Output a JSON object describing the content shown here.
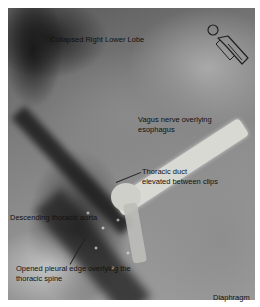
{
  "figure": {
    "type": "annotated surgical photograph (grayscale)",
    "labels": {
      "lung": "Collapsed Right Lower Lobe",
      "vagus": [
        "Vagus nerve overlying",
        "esophagus"
      ],
      "duct": [
        "Thoracic duct",
        "elevated between clips"
      ],
      "aorta": "Descending thoracic aorta",
      "pleura": [
        "Opened pleural edge overlying the",
        "thoracic spine"
      ],
      "diaphragm": "Diaphragm"
    },
    "orientation_icon": "patient-body-orientation-icon"
  }
}
